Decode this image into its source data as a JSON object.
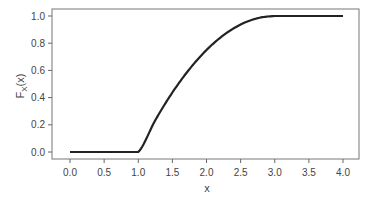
{
  "chart_data": {
    "type": "line",
    "title": "",
    "xlabel": "x",
    "ylabel": "F_X(x)",
    "ylabel_main": "F",
    "ylabel_sub": "X",
    "ylabel_tail": "(x)",
    "xlim": [
      0,
      4
    ],
    "ylim": [
      0,
      1
    ],
    "xticks": [
      0.0,
      0.5,
      1.0,
      1.5,
      2.0,
      2.5,
      3.0,
      3.5,
      4.0
    ],
    "xtick_labels": [
      "0.0",
      "0.5",
      "1.0",
      "1.5",
      "2.0",
      "2.5",
      "3.0",
      "3.5",
      "4.0"
    ],
    "yticks": [
      0.0,
      0.2,
      0.4,
      0.6,
      0.8,
      1.0
    ],
    "ytick_labels": [
      "0.0",
      "0.2",
      "0.4",
      "0.6",
      "0.8",
      "1.0"
    ],
    "grid": false,
    "legend": null,
    "series": [
      {
        "name": "F_X(x)",
        "color": "#222222",
        "x": [
          0.0,
          0.5,
          1.0,
          1.25,
          1.5,
          1.75,
          2.0,
          2.25,
          2.5,
          2.75,
          3.0,
          3.5,
          4.0
        ],
        "y": [
          0.0,
          0.0,
          0.0,
          0.234,
          0.4375,
          0.609,
          0.75,
          0.859,
          0.9375,
          0.984,
          1.0,
          1.0,
          1.0
        ]
      }
    ]
  },
  "colors": {
    "axis": "#666666",
    "line": "#222222",
    "text": "#444444"
  }
}
